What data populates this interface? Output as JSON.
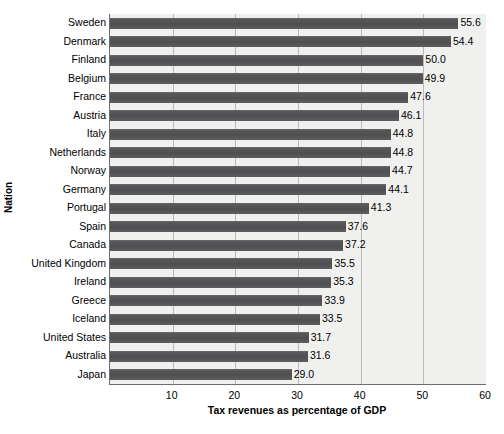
{
  "chart_data": {
    "type": "bar",
    "orientation": "horizontal",
    "title": "",
    "xlabel": "Tax revenues as percentage of GDP",
    "ylabel": "Nation",
    "xlim": [
      0,
      60
    ],
    "xticks": [
      10,
      20,
      30,
      40,
      50,
      60
    ],
    "xtick_labels": [
      "10",
      "20",
      "30",
      "40",
      "50",
      "60"
    ],
    "grid": "vertical",
    "legend": "none",
    "bar_color": "#58585a",
    "plot_background": "#f0f0ef",
    "gridline_color": "#b9b9b9",
    "axis_color": "#6e6e6e",
    "categories": [
      "Sweden",
      "Denmark",
      "Finland",
      "Belgium",
      "France",
      "Austria",
      "Italy",
      "Netherlands",
      "Norway",
      "Germany",
      "Portugal",
      "Spain",
      "Canada",
      "United Kingdom",
      "Ireland",
      "Greece",
      "Iceland",
      "United States",
      "Australia",
      "Japan"
    ],
    "values": [
      55.6,
      54.4,
      50.0,
      49.9,
      47.6,
      46.1,
      44.8,
      44.8,
      44.7,
      44.1,
      41.3,
      37.6,
      37.2,
      35.5,
      35.3,
      33.9,
      33.5,
      31.7,
      31.6,
      29.0
    ],
    "value_labels": [
      "55.6",
      "54.4",
      "50.0",
      "49.9",
      "47.6",
      "46.1",
      "44.8",
      "44.8",
      "44.7",
      "44.1",
      "41.3",
      "37.6",
      "37.2",
      "35.5",
      "35.3",
      "33.9",
      "33.5",
      "31.7",
      "31.6",
      "29.0"
    ]
  }
}
